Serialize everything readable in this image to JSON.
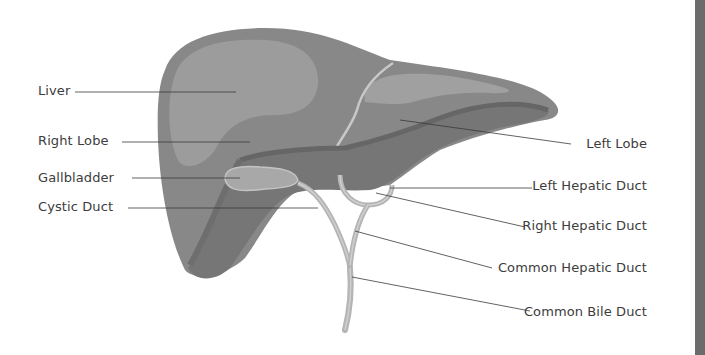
{
  "diagram": {
    "colors": {
      "background": "#ffffff",
      "liver_outer": "#8a8a8a",
      "liver_mid": "#7e7e7e",
      "liver_highlight": "#9e9e9e",
      "liver_dark": "#6c6c6c",
      "gallbladder": "#a6a6a6",
      "duct": "#b4b4b4",
      "duct_edge": "#cfcfcf",
      "leader_line": "#3a3a3a",
      "label_text": "#3c3c3c",
      "side_bar": "#6b6b6b"
    },
    "labels_left": [
      {
        "id": "liver",
        "text": "Liver",
        "x": 38,
        "y": 83,
        "line_x1": 75,
        "line_x2": 236,
        "line_y": 92
      },
      {
        "id": "right-lobe",
        "text": "Right Lobe",
        "x": 38,
        "y": 133,
        "line_x1": 122,
        "line_x2": 250,
        "line_y": 142
      },
      {
        "id": "gallbladder",
        "text": "Gallbladder",
        "x": 38,
        "y": 170,
        "line_x1": 132,
        "line_x2": 240,
        "line_y": 178
      },
      {
        "id": "cystic-duct",
        "text": "Cystic Duct",
        "x": 38,
        "y": 199,
        "line_x1": 128,
        "line_x2": 318,
        "line_y": 208
      }
    ],
    "labels_right": [
      {
        "id": "left-lobe",
        "text": "Left Lobe",
        "right": 58,
        "y": 136,
        "line_x1": 400,
        "line_y1": 120,
        "line_x2": 571,
        "line_y2": 144
      },
      {
        "id": "left-hepatic-duct",
        "text": "Left Hepatic Duct",
        "right": 58,
        "y": 178,
        "line_x1": 390,
        "line_y1": 188,
        "line_x2": 532,
        "line_y2": 188
      },
      {
        "id": "right-hepatic-duct",
        "text": "Right Hepatic Duct",
        "right": 58,
        "y": 218,
        "line_x1": 376,
        "line_y1": 193,
        "line_x2": 525,
        "line_y2": 227
      },
      {
        "id": "common-hepatic-duct",
        "text": "Common Hepatic Duct",
        "right": 58,
        "y": 260,
        "line_x1": 355,
        "line_y1": 231,
        "line_x2": 492,
        "line_y2": 268
      },
      {
        "id": "common-bile-duct",
        "text": "Common Bile Duct",
        "right": 58,
        "y": 304,
        "line_x1": 352,
        "line_y1": 277,
        "line_x2": 530,
        "line_y2": 311
      }
    ]
  }
}
